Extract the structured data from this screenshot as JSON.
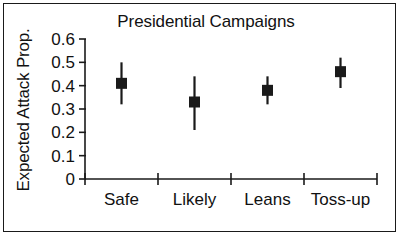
{
  "chart_data": {
    "type": "scatter",
    "title": "Presidential Campaigns",
    "xlabel": "",
    "ylabel": "Expected Attack Prop.",
    "categories": [
      "Safe",
      "Likely",
      "Leans",
      "Toss-up"
    ],
    "values": [
      0.41,
      0.33,
      0.38,
      0.46
    ],
    "error_low": [
      0.32,
      0.21,
      0.32,
      0.39
    ],
    "error_high": [
      0.5,
      0.44,
      0.44,
      0.52
    ],
    "yticks": [
      "0",
      "0.1",
      "0.2",
      "0.3",
      "0.4",
      "0.5",
      "0.6"
    ],
    "ytick_values": [
      0,
      0.1,
      0.2,
      0.3,
      0.4,
      0.5,
      0.6
    ],
    "ylim": [
      0,
      0.6
    ],
    "grid": false,
    "legend": "none",
    "marker": "square",
    "series_name": "Expected Attack Prop.",
    "colors": {
      "marker": "#1a1a1a",
      "errorbar": "#1a1a1a",
      "axis": "#1a1a1a",
      "background": "#ffffff",
      "border": "#1a1a1a"
    }
  }
}
